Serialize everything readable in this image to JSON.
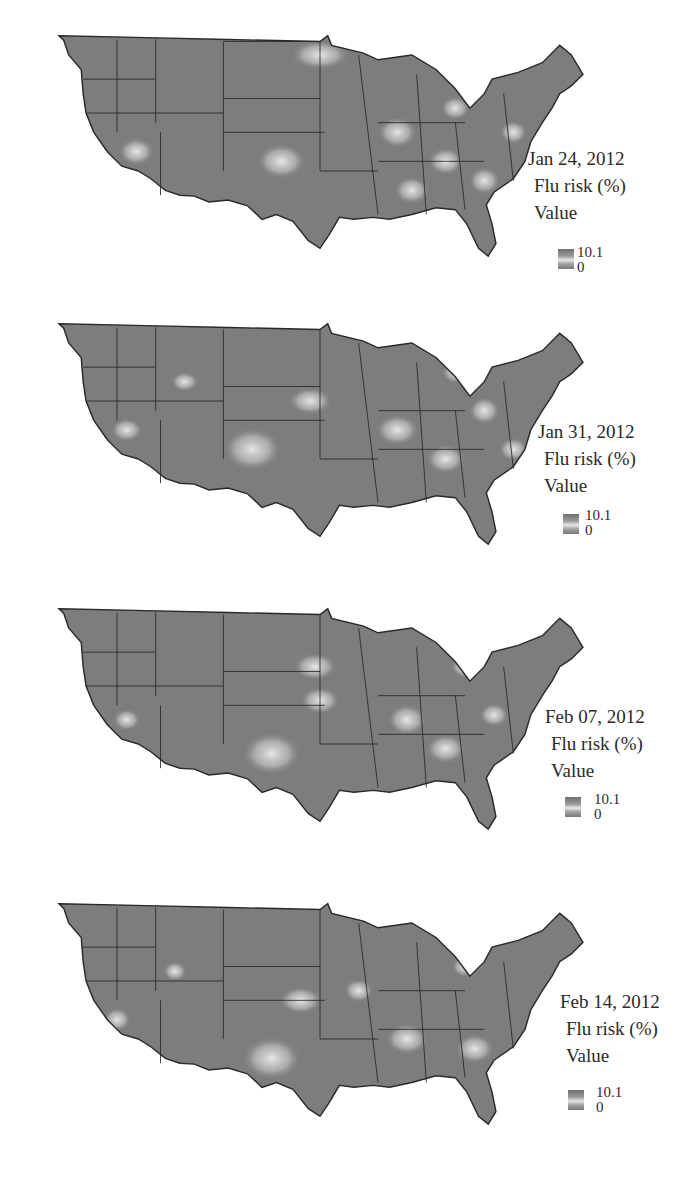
{
  "figure": {
    "panels": [
      {
        "date": "Jan 24, 2012",
        "title": "Flu risk (%)",
        "sub": "Value",
        "max": "10.1",
        "min": "0"
      },
      {
        "date": "Jan 31, 2012",
        "title": "Flu risk (%)",
        "sub": "Value",
        "max": "10.1",
        "min": "0"
      },
      {
        "date": "Feb 07, 2012",
        "title": "Flu risk (%)",
        "sub": "Value",
        "max": "10.1",
        "min": "0"
      },
      {
        "date": "Feb 14, 2012",
        "title": "Flu risk (%)",
        "sub": "Value",
        "max": "10.1",
        "min": "0"
      }
    ]
  },
  "colors": {
    "map_fill": "#7d7d7d",
    "hotspot": "#e6e6e6",
    "border": "#2a2a2a",
    "background": "#ffffff"
  }
}
